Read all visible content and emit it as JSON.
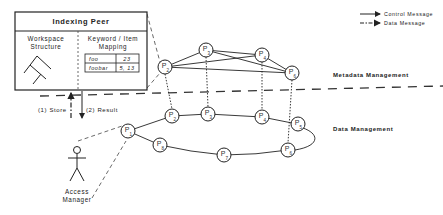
{
  "indexing_peer": {
    "title": "Indexing Peer",
    "left_heading_line1": "Workspace",
    "left_heading_line2": "Structure",
    "right_heading_line1": "Keyword / Item",
    "right_heading_line2": "Mapping",
    "mapping_table": [
      {
        "keyword": "foo",
        "items": "23"
      },
      {
        "keyword": "foobar",
        "items": "5, 13"
      }
    ]
  },
  "legend": {
    "control": "Control Message",
    "data": "Data Message"
  },
  "layers": {
    "metadata": "Metadata Management",
    "data": "Data Management"
  },
  "arrows": {
    "store": "(1) Store",
    "result": "(2) Result"
  },
  "actor": {
    "line1": "Access",
    "line2": "Manager"
  },
  "metadata_ring": {
    "nodes": [
      {
        "id": "P2",
        "letter": "P",
        "sub": "2"
      },
      {
        "id": "P3",
        "letter": "P",
        "sub": "3"
      },
      {
        "id": "P4",
        "letter": "P",
        "sub": "4"
      },
      {
        "id": "P6",
        "letter": "P",
        "sub": "6"
      }
    ]
  },
  "data_ring": {
    "nodes": [
      {
        "id": "P1",
        "letter": "P",
        "sub": "1"
      },
      {
        "id": "P2",
        "letter": "P",
        "sub": "2"
      },
      {
        "id": "P3",
        "letter": "P",
        "sub": "3"
      },
      {
        "id": "P4",
        "letter": "P",
        "sub": "4"
      },
      {
        "id": "P5",
        "letter": "P",
        "sub": "5"
      },
      {
        "id": "P6",
        "letter": "P",
        "sub": "6"
      },
      {
        "id": "P7",
        "letter": "P",
        "sub": "7"
      },
      {
        "id": "P8",
        "letter": "P",
        "sub": "8"
      }
    ]
  }
}
